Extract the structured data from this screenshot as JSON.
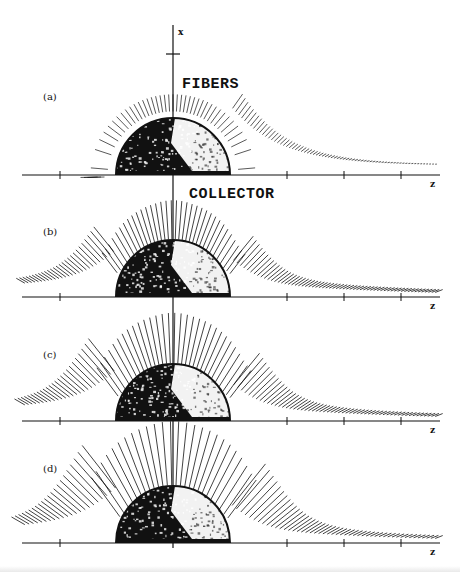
{
  "figure": {
    "x_axis_label": "x",
    "z_axis_label": "z",
    "fibers_label": "FIBERS",
    "collector_label": "COLLECTOR",
    "colors": {
      "ink": "#111111",
      "paper": "#ffffff",
      "sphere_light": "#f2f2f2"
    },
    "panels": [
      {
        "id": "a",
        "label": "(a)",
        "fiber_count": 110,
        "fiber_length": 0.3,
        "upstream_extent": 1.15,
        "downstream_extent": 4.6,
        "show_collector_base": true
      },
      {
        "id": "b",
        "label": "(b)",
        "fiber_count": 120,
        "fiber_length": 0.68,
        "upstream_extent": 2.6,
        "downstream_extent": 4.6,
        "show_collector_base": false
      },
      {
        "id": "c",
        "label": "(c)",
        "fiber_count": 110,
        "fiber_length": 0.88,
        "upstream_extent": 2.6,
        "downstream_extent": 4.6,
        "show_collector_base": false
      },
      {
        "id": "d",
        "label": "(d)",
        "fiber_count": 95,
        "fiber_length": 1.12,
        "upstream_extent": 2.6,
        "downstream_extent": 4.6,
        "show_collector_base": false
      }
    ],
    "z_ticks": [
      -2,
      2,
      3,
      4
    ]
  }
}
